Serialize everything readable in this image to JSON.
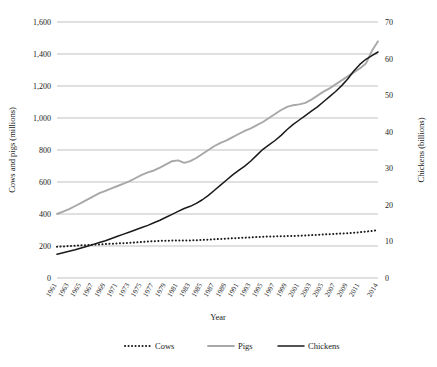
{
  "chart_data": {
    "type": "line",
    "title": "",
    "xlabel": "Year",
    "ylabel": "Cows and pigs (millions)",
    "y2label": "Chickens (billions)",
    "ylim": [
      0,
      1600
    ],
    "y2lim": [
      0,
      70
    ],
    "ytick_labels": [
      "0",
      "200",
      "400",
      "600",
      "800",
      "1,000",
      "1,200",
      "1,400",
      "1,600"
    ],
    "ytick_values": [
      0,
      200,
      400,
      600,
      800,
      1000,
      1200,
      1400,
      1600
    ],
    "y2tick_labels": [
      "0",
      "10",
      "20",
      "30",
      "40",
      "50",
      "60",
      "70"
    ],
    "y2tick_values": [
      0,
      10,
      20,
      30,
      40,
      50,
      60,
      70
    ],
    "grid": true,
    "legend_position": "bottom",
    "xlim": [
      1961,
      2014
    ],
    "xtick_labels": [
      "1961",
      "1963",
      "1965",
      "1967",
      "1969",
      "1971",
      "1973",
      "1975",
      "1977",
      "1979",
      "1981",
      "1983",
      "1985",
      "1987",
      "1989",
      "1991",
      "1993",
      "1995",
      "1997",
      "1999",
      "2001",
      "2003",
      "2005",
      "2007",
      "2009",
      "2011",
      "2014"
    ],
    "x": [
      1961,
      1962,
      1963,
      1964,
      1965,
      1966,
      1967,
      1968,
      1969,
      1970,
      1971,
      1972,
      1973,
      1974,
      1975,
      1976,
      1977,
      1978,
      1979,
      1980,
      1981,
      1982,
      1983,
      1984,
      1985,
      1986,
      1987,
      1988,
      1989,
      1990,
      1991,
      1992,
      1993,
      1994,
      1995,
      1996,
      1997,
      1998,
      1999,
      2000,
      2001,
      2002,
      2003,
      2004,
      2005,
      2006,
      2007,
      2008,
      2009,
      2010,
      2011,
      2012,
      2013,
      2014
    ],
    "series": [
      {
        "name": "Cows",
        "axis": "left",
        "units": "millions",
        "color": "#1a1a1a",
        "style": "dotted",
        "values": [
          195,
          197,
          200,
          202,
          204,
          206,
          208,
          210,
          212,
          214,
          216,
          218,
          220,
          222,
          225,
          228,
          230,
          232,
          233,
          234,
          234,
          235,
          235,
          236,
          238,
          240,
          242,
          244,
          246,
          248,
          250,
          252,
          254,
          256,
          258,
          259,
          260,
          261,
          262,
          263,
          264,
          266,
          268,
          270,
          272,
          274,
          276,
          278,
          280,
          283,
          286,
          290,
          294,
          300
        ]
      },
      {
        "name": "Pigs",
        "axis": "left",
        "units": "millions",
        "color": "#a8a8a8",
        "style": "solid",
        "values": [
          400,
          415,
          430,
          450,
          470,
          490,
          510,
          530,
          545,
          560,
          575,
          590,
          605,
          625,
          645,
          660,
          672,
          690,
          710,
          730,
          735,
          720,
          730,
          750,
          775,
          800,
          825,
          845,
          860,
          880,
          900,
          920,
          935,
          955,
          975,
          1000,
          1025,
          1050,
          1070,
          1080,
          1085,
          1095,
          1115,
          1140,
          1165,
          1185,
          1210,
          1235,
          1260,
          1285,
          1310,
          1340,
          1420,
          1480
        ]
      },
      {
        "name": "Chickens",
        "axis": "right",
        "units": "billions",
        "color": "#1a1a1a",
        "style": "solid",
        "values": [
          6.5,
          6.9,
          7.3,
          7.7,
          8.2,
          8.7,
          9.2,
          9.7,
          10.2,
          10.8,
          11.4,
          12.0,
          12.6,
          13.2,
          13.8,
          14.4,
          15.1,
          15.8,
          16.6,
          17.4,
          18.2,
          19.0,
          19.6,
          20.4,
          21.4,
          22.6,
          24.0,
          25.4,
          26.8,
          28.2,
          29.4,
          30.6,
          32.0,
          33.6,
          35.2,
          36.4,
          37.6,
          39.0,
          40.6,
          42.0,
          43.2,
          44.4,
          45.6,
          46.8,
          48.2,
          49.6,
          51.0,
          52.6,
          54.4,
          56.6,
          58.4,
          59.8,
          60.8,
          61.8
        ]
      }
    ]
  },
  "legend": {
    "items": [
      {
        "label": "Cows"
      },
      {
        "label": "Pigs"
      },
      {
        "label": "Chickens"
      }
    ]
  }
}
